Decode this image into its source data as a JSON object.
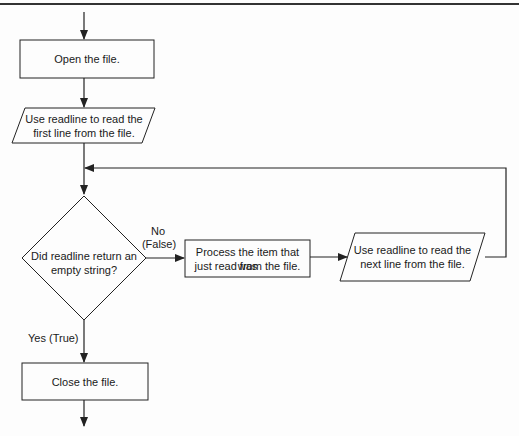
{
  "flowchart": {
    "nodes": {
      "open": {
        "type": "process",
        "text": "Open the file."
      },
      "read_first": {
        "type": "input-output",
        "line1": "Use readline to read the",
        "line2": "first line from the file."
      },
      "decision": {
        "type": "decision",
        "line1": "Did readline return an",
        "line2": "empty string?"
      },
      "process_item": {
        "type": "process",
        "line1": "Process the item that was",
        "line2": "just read from the file."
      },
      "read_next": {
        "type": "input-output",
        "line1": "Use readline to read the",
        "line2": "next line from the file."
      },
      "close": {
        "type": "process",
        "text": "Close the file."
      }
    },
    "edges": {
      "no_line1": "No",
      "no_line2": "(False)",
      "yes": "Yes (True)"
    },
    "colors": {
      "stroke": "#222222",
      "background": "#fdfdfd",
      "text": "#1a1a1a"
    }
  }
}
